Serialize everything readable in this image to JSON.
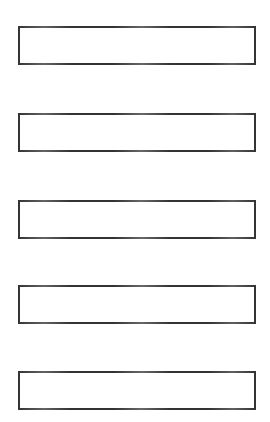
{
  "page": {
    "name": "blank-form-field-sheet",
    "width": 270,
    "height": 422,
    "background_color": "#ffffff"
  },
  "style": {
    "border_color": "#333333",
    "border_width_px": 2,
    "fill_color": "#ffffff"
  },
  "form": {
    "fields": [
      {
        "index": 1,
        "value": "",
        "placeholder": "",
        "x": 18,
        "y": 26,
        "width": 238,
        "height": 39
      },
      {
        "index": 2,
        "value": "",
        "placeholder": "",
        "x": 18,
        "y": 113,
        "width": 238,
        "height": 39
      },
      {
        "index": 3,
        "value": "",
        "placeholder": "",
        "x": 18,
        "y": 200,
        "width": 238,
        "height": 39
      },
      {
        "index": 4,
        "value": "",
        "placeholder": "",
        "x": 18,
        "y": 285,
        "width": 238,
        "height": 39
      },
      {
        "index": 5,
        "value": "",
        "placeholder": "",
        "x": 18,
        "y": 371,
        "width": 238,
        "height": 39
      }
    ]
  }
}
